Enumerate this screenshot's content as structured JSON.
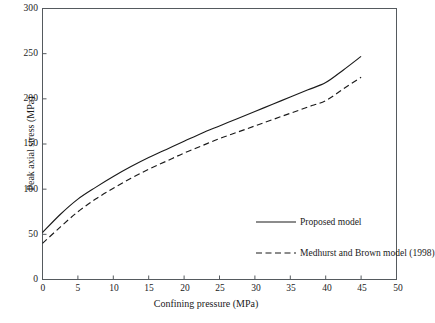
{
  "chart_data": {
    "type": "line",
    "title": "",
    "xlabel": "Confining pressure (MPa)",
    "ylabel": "Peak axial stress (MPa)",
    "xlim": [
      0,
      50
    ],
    "ylim": [
      0,
      300
    ],
    "xticks": [
      0,
      5,
      10,
      15,
      20,
      25,
      30,
      35,
      40,
      45,
      50
    ],
    "yticks": [
      0,
      50,
      100,
      150,
      200,
      250,
      300
    ],
    "xtick_labels": [
      "0",
      "5",
      "10",
      "15",
      "20",
      "25",
      "30",
      "35",
      "40",
      "45",
      "50"
    ],
    "ytick_labels": [
      "0",
      "50",
      "100",
      "150",
      "200",
      "250",
      "300"
    ],
    "grid": false,
    "legend_position": "inside-right",
    "x": [
      0,
      2.5,
      5,
      7.5,
      10,
      12.5,
      15,
      17.5,
      20,
      22.5,
      25,
      27.5,
      30,
      32.5,
      35,
      37.5,
      40,
      42.5,
      45
    ],
    "series": [
      {
        "name": "Proposed model",
        "style": "solid",
        "color": "#1a1a1a",
        "values": [
          52,
          72,
          89,
          102,
          114,
          125,
          135,
          144,
          153,
          162,
          170,
          178,
          186,
          194,
          202,
          210,
          218,
          232,
          247
        ]
      },
      {
        "name": "Medhurst and Brown model (1998)",
        "style": "dashed",
        "color": "#1a1a1a",
        "values": [
          40,
          58,
          75,
          89,
          101,
          112,
          122,
          131,
          140,
          148,
          156,
          163,
          170,
          177,
          184,
          191,
          198,
          211,
          224
        ]
      }
    ],
    "legend": [
      {
        "label": "Proposed model",
        "style": "solid"
      },
      {
        "label": "Medhurst and Brown model (1998)",
        "style": "dashed"
      }
    ]
  }
}
